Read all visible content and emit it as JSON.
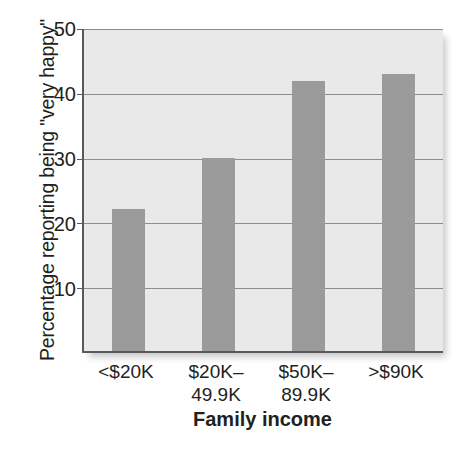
{
  "chart_data": {
    "type": "bar",
    "title": "",
    "xlabel": "Family income",
    "ylabel": "Percentage reporting being \"very happy\"",
    "categories": [
      "<$20K",
      "$20K– 49.9K",
      "$50K– 89.9K",
      ">$90K"
    ],
    "category_lines": [
      [
        "<$20K"
      ],
      [
        "$20K–",
        "49.9K"
      ],
      [
        "$50K–",
        "89.9K"
      ],
      [
        ">$90K"
      ]
    ],
    "values": [
      22,
      30,
      42,
      43
    ],
    "ylim": [
      0,
      50
    ],
    "yticks": [
      10,
      20,
      30,
      40,
      50
    ],
    "ytick_labels": [
      "10",
      "20",
      "30",
      "40",
      "50"
    ],
    "grid": true,
    "legend": false,
    "colors": {
      "bar": "#9b9b9b",
      "plot_background": "#e9e9e9",
      "gridline": "#8b8d8f",
      "axis": "#58595b",
      "page_background": "#ffffff",
      "text": "#231f20"
    }
  },
  "axis": {
    "y_title": "Percentage reporting being \"very happy\"",
    "x_title": "Family income",
    "y_tick_0": "10",
    "y_tick_1": "20",
    "y_tick_2": "30",
    "y_tick_3": "40",
    "y_tick_4": "50"
  },
  "x_labels": {
    "cat0_line0": "<$20K",
    "cat1_line0": "$20K–",
    "cat1_line1": "49.9K",
    "cat2_line0": "$50K–",
    "cat2_line1": "89.9K",
    "cat3_line0": ">$90K"
  }
}
